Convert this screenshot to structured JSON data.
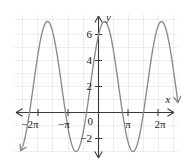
{
  "chart_data": {
    "type": "line",
    "title": "",
    "subtitle": "",
    "xlabel": "x",
    "ylabel": "y",
    "grid": true,
    "legend": null,
    "xlim": [
      -7.2,
      7.2
    ],
    "ylim": [
      -4.0,
      8.0
    ],
    "x_unit": "pi",
    "x_tick_labels": [
      "−2π",
      "−π",
      "π",
      "2π"
    ],
    "x_tick_values": [
      -6.2832,
      -3.1416,
      3.1416,
      6.2832
    ],
    "y_tick_labels": [
      "6",
      "4",
      "2",
      "0",
      "−2"
    ],
    "y_tick_values": [
      6,
      4,
      2,
      0,
      -2
    ],
    "origin_label": "0",
    "series": [
      {
        "name": "cosine curve",
        "color": "#8a8a8a",
        "amplitude": 5,
        "midline": 2,
        "period_in_pi": 1.9,
        "maximum_value": 7,
        "minimum_value": -3,
        "maxima_x_labels": [
          "−1.7π",
          "0.2π",
          "2.1π"
        ],
        "minima_x_labels": [
          "−0.75π",
          "1.15π"
        ],
        "start_arrow": "down-left",
        "end_arrow": "up-right"
      }
    ],
    "annotations": [],
    "colors": {
      "curve": "#8a8a8a",
      "axis": "#3a3a3a",
      "grid": "#eceaea",
      "background": "#ffffff",
      "text": "#1a1a1a"
    }
  },
  "axes": {
    "x_axis_name": "x-axis",
    "y_axis_name": "y-axis",
    "x_label": "x",
    "y_label": "y",
    "x_arrow_left": "←",
    "x_arrow_right": "→",
    "y_arrow_up": "↑",
    "y_arrow_down": "↓"
  },
  "ticks": {
    "x": [
      {
        "label": "−2π",
        "value": -6.2832
      },
      {
        "label": "−π",
        "value": -3.1416
      },
      {
        "label": "π",
        "value": 3.1416
      },
      {
        "label": "2π",
        "value": 6.2832
      }
    ],
    "y": [
      {
        "label": "6",
        "value": 6
      },
      {
        "label": "4",
        "value": 4
      },
      {
        "label": "2",
        "value": 2
      },
      {
        "label": "0",
        "value": 0
      },
      {
        "label": "−2",
        "value": -2
      }
    ]
  }
}
